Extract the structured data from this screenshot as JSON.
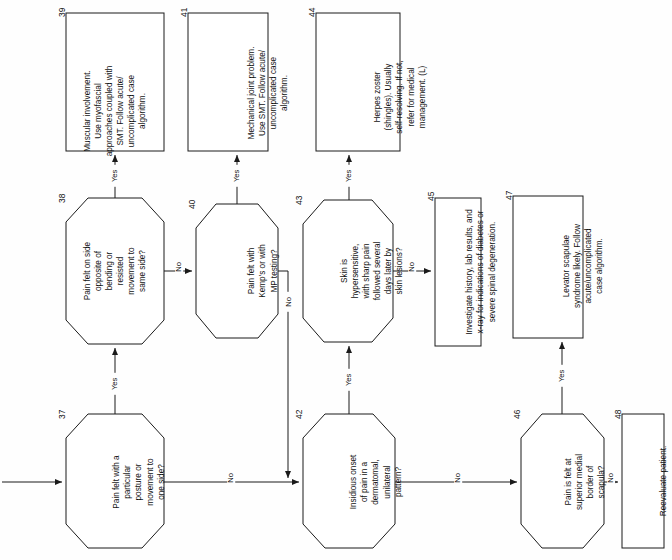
{
  "diagram": {
    "orientation": "rotated-90-ccw",
    "nodes": [
      {
        "id": "37",
        "number": "37",
        "shape": "hexagon",
        "text": "Pain felt with a\nparticular\nposture or\nmovement to\none side?"
      },
      {
        "id": "38",
        "number": "38",
        "shape": "hexagon",
        "text": "Pain felt on side\nopposite of\nbending or\nresisted\nmovement to\nsame side?"
      },
      {
        "id": "39",
        "number": "39",
        "shape": "rect",
        "text": "Muscular involvement.\nUse myofascial\napproaches coupled with\nSMT. Follow acute/\nuncomplicated case\nalgorithm."
      },
      {
        "id": "40",
        "number": "40",
        "shape": "hexagon",
        "text": "Pain felt with\nKemp's or with\nMP testing?"
      },
      {
        "id": "41",
        "number": "41",
        "shape": "rect",
        "text": "Mechanical joint problem.\nUse SMT. Follow acute/\nuncomplicated case\nalgorithm."
      },
      {
        "id": "42",
        "number": "42",
        "shape": "hexagon",
        "text": "Insidious onset\nof pain in a\ndermatomal,\nunilateral\npattern?"
      },
      {
        "id": "43",
        "number": "43",
        "shape": "hexagon",
        "text": "Skin is\nhypersensitive,\nwith sharp pain\nfollowed several\ndays later by\nskin lesions?"
      },
      {
        "id": "44",
        "number": "44",
        "shape": "rect",
        "text": "Herpes zoster\n(shingles). Usually\nself-resolving. If not,\nrefer for medical\nmanagement. (L)"
      },
      {
        "id": "45",
        "number": "45",
        "shape": "rect",
        "text": "Investigate history, lab results, and\nx-ray for indications of diabetes or\nsevere spinal degeneration."
      },
      {
        "id": "46",
        "number": "46",
        "shape": "hexagon",
        "text": "Pain is felt at\nsuperior medial\nborder of\nscapula?"
      },
      {
        "id": "47",
        "number": "47",
        "shape": "rect",
        "text": "Levator scapulae\nsyndrome likely. Follow\nacute/uncomplicated\ncase algorithm."
      },
      {
        "id": "48",
        "number": "48",
        "shape": "rect",
        "text": "Reevaluate patient."
      }
    ],
    "edges": [
      {
        "id": "e-in-37",
        "from": "entry",
        "to": "37",
        "label": ""
      },
      {
        "id": "e-37-38",
        "from": "37",
        "to": "38",
        "label": "Yes"
      },
      {
        "id": "e-37-42",
        "from": "37",
        "to": "42",
        "label": "No"
      },
      {
        "id": "e-38-39",
        "from": "38",
        "to": "39",
        "label": "Yes"
      },
      {
        "id": "e-38-40",
        "from": "38",
        "to": "40",
        "label": "No"
      },
      {
        "id": "e-40-41",
        "from": "40",
        "to": "41",
        "label": "Yes"
      },
      {
        "id": "e-40-42",
        "from": "40",
        "to": "42",
        "label": "No"
      },
      {
        "id": "e-42-43",
        "from": "42",
        "to": "43",
        "label": "Yes"
      },
      {
        "id": "e-42-46",
        "from": "42",
        "to": "46",
        "label": "No"
      },
      {
        "id": "e-43-44",
        "from": "43",
        "to": "44",
        "label": "Yes"
      },
      {
        "id": "e-43-45",
        "from": "43",
        "to": "45",
        "label": "No"
      },
      {
        "id": "e-46-47",
        "from": "46",
        "to": "47",
        "label": "Yes"
      },
      {
        "id": "e-46-48",
        "from": "46",
        "to": "48",
        "label": "No"
      }
    ],
    "colors": {
      "stroke": "#1a1a1a",
      "background": "#fefefe",
      "text": "#111111"
    }
  }
}
